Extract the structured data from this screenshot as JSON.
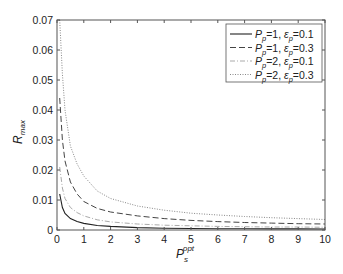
{
  "chart_data": {
    "type": "line",
    "title": "",
    "xlabel": "P_s^opt",
    "xlabel_main": "P",
    "xlabel_sub": "s",
    "xlabel_sup": "opt",
    "ylabel": "R_max",
    "ylabel_main": "R",
    "ylabel_sub": "max",
    "xlim": [
      0,
      10
    ],
    "ylim": [
      0,
      0.07
    ],
    "x_ticks": [
      "0",
      "1",
      "2",
      "3",
      "4",
      "5",
      "6",
      "7",
      "8",
      "9",
      "10"
    ],
    "y_ticks": [
      "0",
      "0.01",
      "0.02",
      "0.03",
      "0.04",
      "0.05",
      "0.06",
      "0.07"
    ],
    "grid": false,
    "legend_position": "upper right",
    "x": [
      0.1,
      0.2,
      0.3,
      0.5,
      0.75,
      1,
      1.5,
      2,
      3,
      4,
      5,
      6,
      7,
      8,
      9,
      10
    ],
    "series": [
      {
        "name": "P_p=1, ε_p=0.1",
        "label_parts": {
          "P": "P",
          "p_sub": "p",
          "val1": "=1, ",
          "eps": "ε",
          "e_sub": "p",
          "val2": "=0.1"
        },
        "style": "solid",
        "color": "#222222",
        "values": [
          0.012,
          0.0075,
          0.0055,
          0.0038,
          0.0028,
          0.0022,
          0.0015,
          0.0012,
          0.0008,
          0.0006,
          0.0005,
          0.00045,
          0.0004,
          0.00037,
          0.00035,
          0.00033
        ]
      },
      {
        "name": "P_p=1, ε_p=0.3",
        "label_parts": {
          "P": "P",
          "p_sub": "p",
          "val1": "=1, ",
          "eps": "ε",
          "e_sub": "p",
          "val2": "=0.3"
        },
        "style": "dashed",
        "color": "#444444",
        "values": [
          0.044,
          0.03,
          0.023,
          0.016,
          0.012,
          0.0095,
          0.0072,
          0.006,
          0.0047,
          0.0038,
          0.0032,
          0.0028,
          0.0025,
          0.0023,
          0.0021,
          0.002
        ]
      },
      {
        "name": "P_p=2, ε_p=0.1",
        "label_parts": {
          "P": "P",
          "p_sub": "p",
          "val1": "=2, ",
          "eps": "ε",
          "e_sub": "p",
          "val2": "=0.1"
        },
        "style": "dashdot",
        "color": "#aaaaaa",
        "values": [
          0.021,
          0.014,
          0.0105,
          0.0075,
          0.0058,
          0.0047,
          0.0034,
          0.0027,
          0.002,
          0.0016,
          0.0014,
          0.0012,
          0.0011,
          0.001,
          0.001,
          0.0009
        ]
      },
      {
        "name": "P_p=2, ε_p=0.3",
        "label_parts": {
          "P": "P",
          "p_sub": "p",
          "val1": "=2, ",
          "eps": "ε",
          "e_sub": "p",
          "val2": "=0.3"
        },
        "style": "dotted",
        "color": "#888888",
        "values": [
          0.07,
          0.052,
          0.04,
          0.028,
          0.022,
          0.018,
          0.013,
          0.0105,
          0.008,
          0.0066,
          0.0056,
          0.005,
          0.0045,
          0.0041,
          0.0038,
          0.0035
        ]
      }
    ]
  }
}
